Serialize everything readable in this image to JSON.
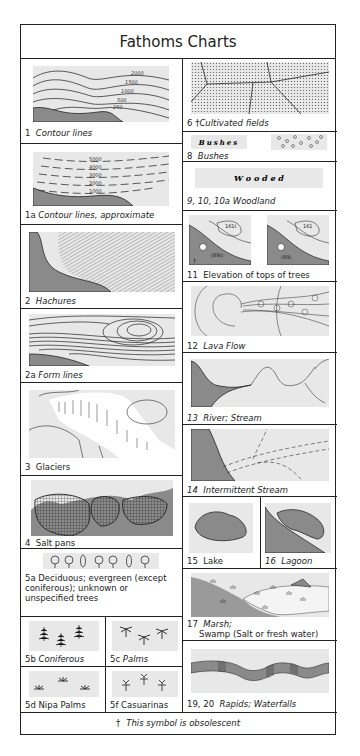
{
  "title": "Fathoms Charts",
  "obsolete_mark": "†",
  "footer": "This symbol is obsolescent",
  "colors": {
    "land": "#8a8a8a",
    "tint": "#e8e8e8",
    "line": "#222222"
  },
  "left_column": [
    {
      "id": "1",
      "label": "Contour lines",
      "values": [
        "2000",
        "1500",
        "1000",
        "500",
        "250"
      ]
    },
    {
      "id": "1a",
      "label": "Contour lines, approximate",
      "values": [
        "5000",
        "4000",
        "3000",
        "2000",
        "1000"
      ]
    },
    {
      "id": "2",
      "label": "Hachures"
    },
    {
      "id": "2a",
      "label": "Form lines"
    },
    {
      "id": "3",
      "label": "Glaciers"
    },
    {
      "id": "4",
      "label": "Salt pans"
    },
    {
      "id": "5a",
      "label": "Deciduous; evergreen (except coniferous); unknown or unspecified trees"
    },
    {
      "id": "5b",
      "label": "Coniferous"
    },
    {
      "id": "5c",
      "label": "Palms"
    },
    {
      "id": "5d",
      "label": "Nipa Palms"
    },
    {
      "id": "5f",
      "label": "Casuarinas"
    }
  ],
  "right_column": [
    {
      "id": "6",
      "label": "Cultivated fields",
      "obsolete": true
    },
    {
      "id": "8",
      "label": "Bushes",
      "sample_text": "Bushes"
    },
    {
      "id": "9, 10, 10a",
      "label": "Woodland",
      "sample_text": "W o o d e d"
    },
    {
      "id": "11",
      "label": "Elevation of tops of trees",
      "values": [
        "161t",
        "(89t)",
        "161",
        "(89)"
      ]
    },
    {
      "id": "12",
      "label": "Lava Flow"
    },
    {
      "id": "13",
      "label": "River; Stream"
    },
    {
      "id": "14",
      "label": "Intermittent Stream"
    },
    {
      "id": "15",
      "label": "Lake"
    },
    {
      "id": "16",
      "label": "Lagoon"
    },
    {
      "id": "17",
      "label": "Marsh;",
      "label2": "Swamp (Salt or fresh water)"
    },
    {
      "id": "19, 20",
      "label": "Rapids; Waterfalls"
    }
  ]
}
